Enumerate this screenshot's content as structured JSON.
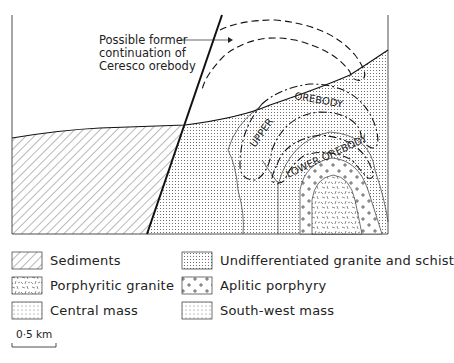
{
  "figure": {
    "annotation": {
      "line1": "Possible former",
      "line2": "continuation of",
      "line3": "Ceresco orebody"
    },
    "labels": {
      "upper": "UPPER",
      "orebody_upper": "OREBODY",
      "lower_orebody": "LOWER OREBODY"
    }
  },
  "legend": {
    "items": [
      {
        "label": "Sediments",
        "pattern": "diagonal-hatch"
      },
      {
        "label": "Porphyritic granite",
        "pattern": "random-dashes"
      },
      {
        "label": "Central mass",
        "pattern": "fine-dots-grid"
      },
      {
        "label": "Undifferentiated granite and schist",
        "pattern": "dense-dots"
      },
      {
        "label": "Aplitic porphyry",
        "pattern": "plus-signs"
      },
      {
        "label": "South-west mass",
        "pattern": "sparse-dots"
      }
    ]
  },
  "scale": {
    "label": "0·5 km"
  },
  "colors": {
    "ink": "#1a1a1a",
    "background": "#ffffff"
  }
}
